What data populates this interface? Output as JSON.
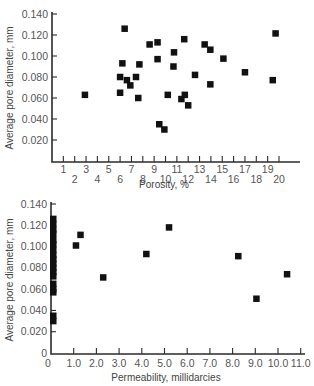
{
  "chart_data": [
    {
      "id": "porosity",
      "type": "scatter",
      "title": "",
      "xlabel": "Porosity, %",
      "ylabel": "Average pore diameter, mm",
      "xlim": [
        0,
        21
      ],
      "ylim": [
        0,
        0.14
      ],
      "grid": false,
      "legend": "none",
      "xticks": [
        1,
        2,
        3,
        4,
        5,
        6,
        7,
        8,
        9,
        10,
        11,
        12,
        13,
        14,
        15,
        16,
        17,
        18,
        19,
        20
      ],
      "xtick_labels": [
        "1",
        "2",
        "3",
        "4",
        "5",
        "6",
        "7",
        "8",
        "9",
        "10",
        "11",
        "12",
        "13",
        "14",
        "15",
        "16",
        "17",
        "18",
        "19",
        "20"
      ],
      "yticks": [
        0.02,
        0.04,
        0.06,
        0.08,
        0.1,
        0.12,
        0.14
      ],
      "ytick_labels": [
        "0.020",
        "0.040",
        "0.060",
        "0.080",
        "0.100",
        "0.120",
        "0.140"
      ],
      "marker": "square",
      "marker_color": "#111111",
      "points": [
        {
          "x": 2.9,
          "y": 0.063
        },
        {
          "x": 6.0,
          "y": 0.08
        },
        {
          "x": 6.0,
          "y": 0.065
        },
        {
          "x": 6.2,
          "y": 0.093
        },
        {
          "x": 6.4,
          "y": 0.126
        },
        {
          "x": 6.6,
          "y": 0.077
        },
        {
          "x": 6.9,
          "y": 0.072
        },
        {
          "x": 7.4,
          "y": 0.08
        },
        {
          "x": 7.6,
          "y": 0.06
        },
        {
          "x": 7.7,
          "y": 0.092
        },
        {
          "x": 8.6,
          "y": 0.111
        },
        {
          "x": 9.3,
          "y": 0.097
        },
        {
          "x": 9.3,
          "y": 0.113
        },
        {
          "x": 9.45,
          "y": 0.035
        },
        {
          "x": 9.9,
          "y": 0.03
        },
        {
          "x": 10.2,
          "y": 0.063
        },
        {
          "x": 10.7,
          "y": 0.09
        },
        {
          "x": 10.75,
          "y": 0.1035
        },
        {
          "x": 11.4,
          "y": 0.059
        },
        {
          "x": 11.65,
          "y": 0.116
        },
        {
          "x": 11.7,
          "y": 0.063
        },
        {
          "x": 12.0,
          "y": 0.053
        },
        {
          "x": 12.6,
          "y": 0.082
        },
        {
          "x": 13.45,
          "y": 0.111
        },
        {
          "x": 13.95,
          "y": 0.106
        },
        {
          "x": 13.95,
          "y": 0.073
        },
        {
          "x": 15.1,
          "y": 0.0975
        },
        {
          "x": 17.0,
          "y": 0.0845
        },
        {
          "x": 19.45,
          "y": 0.077
        },
        {
          "x": 19.7,
          "y": 0.1215
        }
      ]
    },
    {
      "id": "permeability",
      "type": "scatter",
      "title": "",
      "xlabel": "Permeability, millidarcies",
      "ylabel": "Average pore diameter, mm",
      "xlim": [
        0,
        11.0
      ],
      "ylim": [
        0,
        0.14
      ],
      "grid": false,
      "legend": "none",
      "xticks": [
        0,
        1.0,
        2.0,
        3.0,
        4.0,
        5.0,
        6.0,
        7.0,
        8.0,
        9.0,
        10.0,
        11.0
      ],
      "xtick_labels": [
        "0",
        "1.0",
        "2.0",
        "3.0",
        "4.0",
        "5.0",
        "6.0",
        "7.0",
        "8.0",
        "9.0",
        "10.0",
        "11.0"
      ],
      "yticks": [
        0,
        0.02,
        0.04,
        0.06,
        0.08,
        0.1,
        0.12,
        0.14
      ],
      "ytick_labels": [
        "0",
        "0.020",
        "0.040",
        "0.060",
        "0.080",
        "0.100",
        "0.120",
        "0.140"
      ],
      "marker": "square",
      "marker_color": "#111111",
      "points": [
        {
          "x": 0.1,
          "y": 0.126
        },
        {
          "x": 0.1,
          "y": 0.121
        },
        {
          "x": 0.1,
          "y": 0.116
        },
        {
          "x": 0.1,
          "y": 0.112
        },
        {
          "x": 0.1,
          "y": 0.106
        },
        {
          "x": 0.1,
          "y": 0.102
        },
        {
          "x": 0.1,
          "y": 0.097
        },
        {
          "x": 0.1,
          "y": 0.092
        },
        {
          "x": 0.1,
          "y": 0.088
        },
        {
          "x": 0.1,
          "y": 0.084
        },
        {
          "x": 0.1,
          "y": 0.08
        },
        {
          "x": 0.1,
          "y": 0.076
        },
        {
          "x": 0.1,
          "y": 0.072
        },
        {
          "x": 0.1,
          "y": 0.065
        },
        {
          "x": 0.1,
          "y": 0.06
        },
        {
          "x": 0.1,
          "y": 0.057
        },
        {
          "x": 0.1,
          "y": 0.035
        },
        {
          "x": 0.1,
          "y": 0.03
        },
        {
          "x": 1.1,
          "y": 0.101
        },
        {
          "x": 1.3,
          "y": 0.111
        },
        {
          "x": 2.3,
          "y": 0.071
        },
        {
          "x": 4.2,
          "y": 0.093
        },
        {
          "x": 5.2,
          "y": 0.118
        },
        {
          "x": 8.25,
          "y": 0.091
        },
        {
          "x": 9.05,
          "y": 0.051
        },
        {
          "x": 10.4,
          "y": 0.074
        }
      ]
    }
  ]
}
